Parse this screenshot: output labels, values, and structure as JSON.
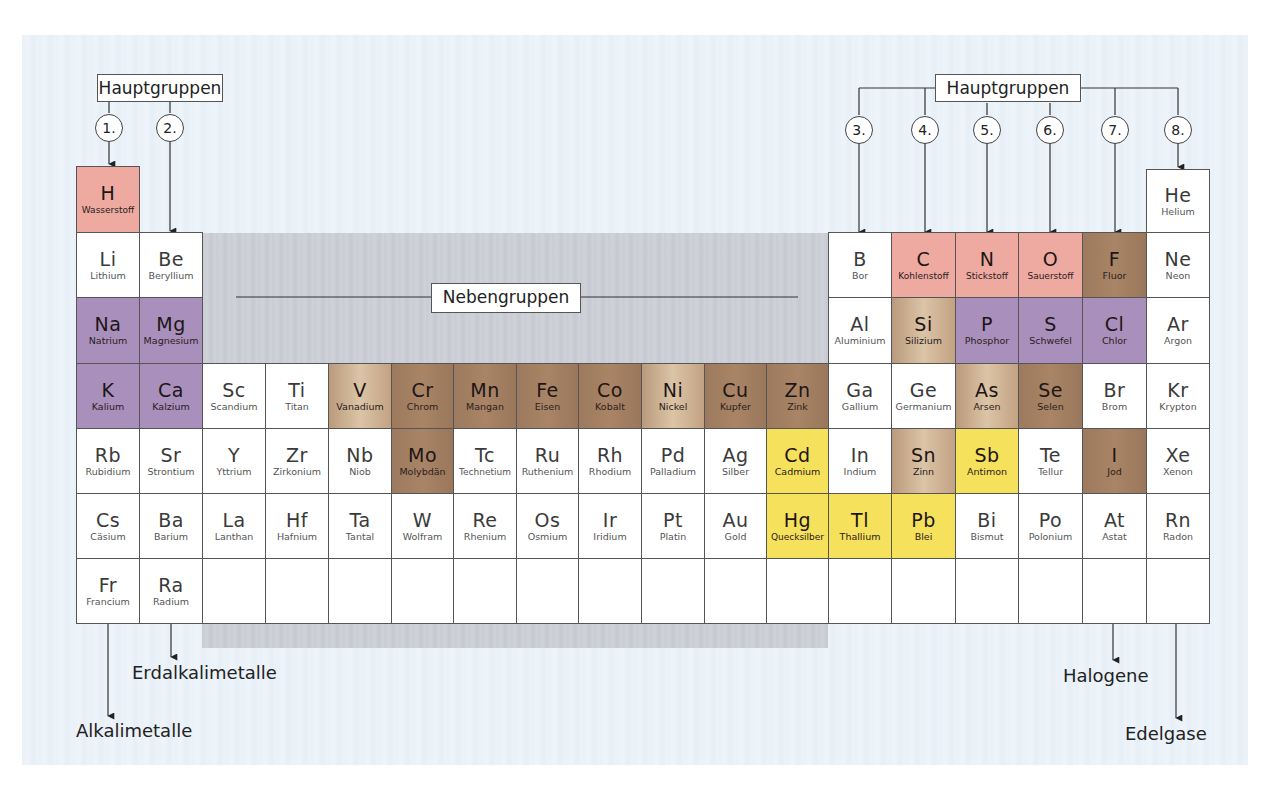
{
  "labels": {
    "main_groups_left": "Hauptgruppen",
    "main_groups_right": "Hauptgruppen",
    "sub_groups": "Nebengruppen",
    "alkali": "Alkalimetalle",
    "alkaline_earth": "Erdalkalimetalle",
    "halogens": "Halogene",
    "noble_gases": "Edelgase"
  },
  "group_numbers": [
    "1.",
    "2.",
    "3.",
    "4.",
    "5.",
    "6.",
    "7.",
    "8."
  ],
  "colors": {
    "pink": "#eeaaa0",
    "purple": "#a98fbb",
    "brown": "#a07c60",
    "tan": "#cfb597",
    "yellow": "#f6e15c",
    "white": "#ffffff",
    "panel": "#eaf1f8",
    "subgroup_backdrop": "#cbced5"
  },
  "elements": [
    {
      "sym": "H",
      "name": "Wasserstoff",
      "row": 0,
      "col": 0,
      "color": "pink"
    },
    {
      "sym": "He",
      "name": "Helium",
      "row": 0,
      "col": 17,
      "color": "white"
    },
    {
      "sym": "Li",
      "name": "Lithium",
      "row": 1,
      "col": 0,
      "color": "white"
    },
    {
      "sym": "Be",
      "name": "Beryllium",
      "row": 1,
      "col": 1,
      "color": "white"
    },
    {
      "sym": "B",
      "name": "Bor",
      "row": 1,
      "col": 12,
      "color": "white"
    },
    {
      "sym": "C",
      "name": "Kohlenstoff",
      "row": 1,
      "col": 13,
      "color": "pink"
    },
    {
      "sym": "N",
      "name": "Stickstoff",
      "row": 1,
      "col": 14,
      "color": "pink"
    },
    {
      "sym": "O",
      "name": "Sauerstoff",
      "row": 1,
      "col": 15,
      "color": "pink"
    },
    {
      "sym": "F",
      "name": "Fluor",
      "row": 1,
      "col": 16,
      "color": "brown"
    },
    {
      "sym": "Ne",
      "name": "Neon",
      "row": 1,
      "col": 17,
      "color": "white"
    },
    {
      "sym": "Na",
      "name": "Natrium",
      "row": 2,
      "col": 0,
      "color": "purple"
    },
    {
      "sym": "Mg",
      "name": "Magnesium",
      "row": 2,
      "col": 1,
      "color": "purple"
    },
    {
      "sym": "Al",
      "name": "Aluminium",
      "row": 2,
      "col": 12,
      "color": "white"
    },
    {
      "sym": "Si",
      "name": "Silizium",
      "row": 2,
      "col": 13,
      "color": "tan"
    },
    {
      "sym": "P",
      "name": "Phosphor",
      "row": 2,
      "col": 14,
      "color": "purple"
    },
    {
      "sym": "S",
      "name": "Schwefel",
      "row": 2,
      "col": 15,
      "color": "purple"
    },
    {
      "sym": "Cl",
      "name": "Chlor",
      "row": 2,
      "col": 16,
      "color": "purple"
    },
    {
      "sym": "Ar",
      "name": "Argon",
      "row": 2,
      "col": 17,
      "color": "white"
    },
    {
      "sym": "K",
      "name": "Kalium",
      "row": 3,
      "col": 0,
      "color": "purple"
    },
    {
      "sym": "Ca",
      "name": "Kalzium",
      "row": 3,
      "col": 1,
      "color": "purple"
    },
    {
      "sym": "Sc",
      "name": "Scandium",
      "row": 3,
      "col": 2,
      "color": "white"
    },
    {
      "sym": "Ti",
      "name": "Titan",
      "row": 3,
      "col": 3,
      "color": "white"
    },
    {
      "sym": "V",
      "name": "Vanadium",
      "row": 3,
      "col": 4,
      "color": "tan"
    },
    {
      "sym": "Cr",
      "name": "Chrom",
      "row": 3,
      "col": 5,
      "color": "brown"
    },
    {
      "sym": "Mn",
      "name": "Mangan",
      "row": 3,
      "col": 6,
      "color": "brown"
    },
    {
      "sym": "Fe",
      "name": "Eisen",
      "row": 3,
      "col": 7,
      "color": "brown"
    },
    {
      "sym": "Co",
      "name": "Kobalt",
      "row": 3,
      "col": 8,
      "color": "brown"
    },
    {
      "sym": "Ni",
      "name": "Nickel",
      "row": 3,
      "col": 9,
      "color": "tan"
    },
    {
      "sym": "Cu",
      "name": "Kupfer",
      "row": 3,
      "col": 10,
      "color": "brown"
    },
    {
      "sym": "Zn",
      "name": "Zink",
      "row": 3,
      "col": 11,
      "color": "brown"
    },
    {
      "sym": "Ga",
      "name": "Gallium",
      "row": 3,
      "col": 12,
      "color": "white"
    },
    {
      "sym": "Ge",
      "name": "Germanium",
      "row": 3,
      "col": 13,
      "color": "white"
    },
    {
      "sym": "As",
      "name": "Arsen",
      "row": 3,
      "col": 14,
      "color": "tan"
    },
    {
      "sym": "Se",
      "name": "Selen",
      "row": 3,
      "col": 15,
      "color": "brown"
    },
    {
      "sym": "Br",
      "name": "Brom",
      "row": 3,
      "col": 16,
      "color": "white"
    },
    {
      "sym": "Kr",
      "name": "Krypton",
      "row": 3,
      "col": 17,
      "color": "white"
    },
    {
      "sym": "Rb",
      "name": "Rubidium",
      "row": 4,
      "col": 0,
      "color": "white"
    },
    {
      "sym": "Sr",
      "name": "Strontium",
      "row": 4,
      "col": 1,
      "color": "white"
    },
    {
      "sym": "Y",
      "name": "Yttrium",
      "row": 4,
      "col": 2,
      "color": "white"
    },
    {
      "sym": "Zr",
      "name": "Zirkonium",
      "row": 4,
      "col": 3,
      "color": "white"
    },
    {
      "sym": "Nb",
      "name": "Niob",
      "row": 4,
      "col": 4,
      "color": "white"
    },
    {
      "sym": "Mo",
      "name": "Molybdän",
      "row": 4,
      "col": 5,
      "color": "brown"
    },
    {
      "sym": "Tc",
      "name": "Technetium",
      "row": 4,
      "col": 6,
      "color": "white"
    },
    {
      "sym": "Ru",
      "name": "Ruthenium",
      "row": 4,
      "col": 7,
      "color": "white"
    },
    {
      "sym": "Rh",
      "name": "Rhodium",
      "row": 4,
      "col": 8,
      "color": "white"
    },
    {
      "sym": "Pd",
      "name": "Palladium",
      "row": 4,
      "col": 9,
      "color": "white"
    },
    {
      "sym": "Ag",
      "name": "Silber",
      "row": 4,
      "col": 10,
      "color": "white"
    },
    {
      "sym": "Cd",
      "name": "Cadmium",
      "row": 4,
      "col": 11,
      "color": "yellow"
    },
    {
      "sym": "In",
      "name": "Indium",
      "row": 4,
      "col": 12,
      "color": "white"
    },
    {
      "sym": "Sn",
      "name": "Zinn",
      "row": 4,
      "col": 13,
      "color": "tan"
    },
    {
      "sym": "Sb",
      "name": "Antimon",
      "row": 4,
      "col": 14,
      "color": "yellow"
    },
    {
      "sym": "Te",
      "name": "Tellur",
      "row": 4,
      "col": 15,
      "color": "white"
    },
    {
      "sym": "I",
      "name": "Jod",
      "row": 4,
      "col": 16,
      "color": "brown"
    },
    {
      "sym": "Xe",
      "name": "Xenon",
      "row": 4,
      "col": 17,
      "color": "white"
    },
    {
      "sym": "Cs",
      "name": "Cäsium",
      "row": 5,
      "col": 0,
      "color": "white"
    },
    {
      "sym": "Ba",
      "name": "Barium",
      "row": 5,
      "col": 1,
      "color": "white"
    },
    {
      "sym": "La",
      "name": "Lanthan",
      "row": 5,
      "col": 2,
      "color": "white"
    },
    {
      "sym": "Hf",
      "name": "Hafnium",
      "row": 5,
      "col": 3,
      "color": "white"
    },
    {
      "sym": "Ta",
      "name": "Tantal",
      "row": 5,
      "col": 4,
      "color": "white"
    },
    {
      "sym": "W",
      "name": "Wolfram",
      "row": 5,
      "col": 5,
      "color": "white"
    },
    {
      "sym": "Re",
      "name": "Rhenium",
      "row": 5,
      "col": 6,
      "color": "white"
    },
    {
      "sym": "Os",
      "name": "Osmium",
      "row": 5,
      "col": 7,
      "color": "white"
    },
    {
      "sym": "Ir",
      "name": "Iridium",
      "row": 5,
      "col": 8,
      "color": "white"
    },
    {
      "sym": "Pt",
      "name": "Platin",
      "row": 5,
      "col": 9,
      "color": "white"
    },
    {
      "sym": "Au",
      "name": "Gold",
      "row": 5,
      "col": 10,
      "color": "white"
    },
    {
      "sym": "Hg",
      "name": "Quecksilber",
      "row": 5,
      "col": 11,
      "color": "yellow"
    },
    {
      "sym": "Tl",
      "name": "Thallium",
      "row": 5,
      "col": 12,
      "color": "yellow"
    },
    {
      "sym": "Pb",
      "name": "Blei",
      "row": 5,
      "col": 13,
      "color": "yellow"
    },
    {
      "sym": "Bi",
      "name": "Bismut",
      "row": 5,
      "col": 14,
      "color": "white"
    },
    {
      "sym": "Po",
      "name": "Polonium",
      "row": 5,
      "col": 15,
      "color": "white"
    },
    {
      "sym": "At",
      "name": "Astat",
      "row": 5,
      "col": 16,
      "color": "white"
    },
    {
      "sym": "Rn",
      "name": "Radon",
      "row": 5,
      "col": 17,
      "color": "white"
    },
    {
      "sym": "Fr",
      "name": "Francium",
      "row": 6,
      "col": 0,
      "color": "white"
    },
    {
      "sym": "Ra",
      "name": "Radium",
      "row": 6,
      "col": 1,
      "color": "white"
    },
    {
      "sym": "",
      "name": "",
      "row": 6,
      "col": 2,
      "color": "white"
    },
    {
      "sym": "",
      "name": "",
      "row": 6,
      "col": 3,
      "color": "white"
    },
    {
      "sym": "",
      "name": "",
      "row": 6,
      "col": 4,
      "color": "white"
    },
    {
      "sym": "",
      "name": "",
      "row": 6,
      "col": 5,
      "color": "white"
    },
    {
      "sym": "",
      "name": "",
      "row": 6,
      "col": 6,
      "color": "white"
    },
    {
      "sym": "",
      "name": "",
      "row": 6,
      "col": 7,
      "color": "white"
    },
    {
      "sym": "",
      "name": "",
      "row": 6,
      "col": 8,
      "color": "white"
    },
    {
      "sym": "",
      "name": "",
      "row": 6,
      "col": 9,
      "color": "white"
    },
    {
      "sym": "",
      "name": "",
      "row": 6,
      "col": 10,
      "color": "white"
    },
    {
      "sym": "",
      "name": "",
      "row": 6,
      "col": 11,
      "color": "white"
    },
    {
      "sym": "",
      "name": "",
      "row": 6,
      "col": 12,
      "color": "white"
    },
    {
      "sym": "",
      "name": "",
      "row": 6,
      "col": 13,
      "color": "white"
    },
    {
      "sym": "",
      "name": "",
      "row": 6,
      "col": 14,
      "color": "white"
    },
    {
      "sym": "",
      "name": "",
      "row": 6,
      "col": 15,
      "color": "white"
    },
    {
      "sym": "",
      "name": "",
      "row": 6,
      "col": 16,
      "color": "white"
    },
    {
      "sym": "",
      "name": "",
      "row": 6,
      "col": 17,
      "color": "white"
    }
  ]
}
